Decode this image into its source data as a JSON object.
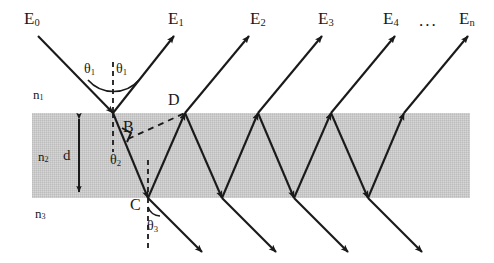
{
  "figure": {
    "type": "optics-ray-diagram",
    "colors": {
      "film_fill": "#c9c9c9",
      "ray": "#1a1a1a",
      "text": "#1a1a1a",
      "background": "#ffffff"
    },
    "film": {
      "x": 32,
      "y": 113,
      "width": 438,
      "height": 85
    },
    "beam_labels": [
      {
        "id": "E0",
        "base": "E",
        "sub": "0",
        "x": 24,
        "y": 10
      },
      {
        "id": "E1",
        "base": "E",
        "sub": "1",
        "x": 168,
        "y": 10
      },
      {
        "id": "E2",
        "base": "E",
        "sub": "2",
        "x": 250,
        "y": 10
      },
      {
        "id": "E3",
        "base": "E",
        "sub": "3",
        "x": 318,
        "y": 10
      },
      {
        "id": "E4",
        "base": "E",
        "sub": "4",
        "x": 383,
        "y": 10
      },
      {
        "id": "En",
        "base": "E",
        "sub": "n",
        "x": 459,
        "y": 10
      }
    ],
    "ellipsis": {
      "text": "...",
      "x": 419,
      "y": 12
    },
    "index_labels": [
      {
        "id": "n1",
        "base": "n",
        "sub": "1",
        "x": 33,
        "y": 88
      },
      {
        "id": "n2",
        "base": "n",
        "sub": "2",
        "x": 38,
        "y": 150
      },
      {
        "id": "n3",
        "base": "n",
        "sub": "3",
        "x": 35,
        "y": 207
      }
    ],
    "thickness_label": {
      "text": "d",
      "x": 63,
      "y": 148
    },
    "point_labels": [
      {
        "id": "B",
        "text": "B",
        "x": 123,
        "y": 119
      },
      {
        "id": "C",
        "text": "C",
        "x": 130,
        "y": 197
      },
      {
        "id": "D",
        "text": "D",
        "x": 168,
        "y": 92
      }
    ],
    "angle_labels": [
      {
        "id": "theta1-incident",
        "base": "θ",
        "sub": "1",
        "x": 84,
        "y": 62
      },
      {
        "id": "theta1-reflected",
        "base": "θ",
        "sub": "1",
        "x": 116,
        "y": 62
      },
      {
        "id": "theta2",
        "base": "θ",
        "sub": "2",
        "x": 110,
        "y": 153
      },
      {
        "id": "theta3",
        "base": "θ",
        "sub": "3",
        "x": 147,
        "y": 219
      }
    ]
  }
}
